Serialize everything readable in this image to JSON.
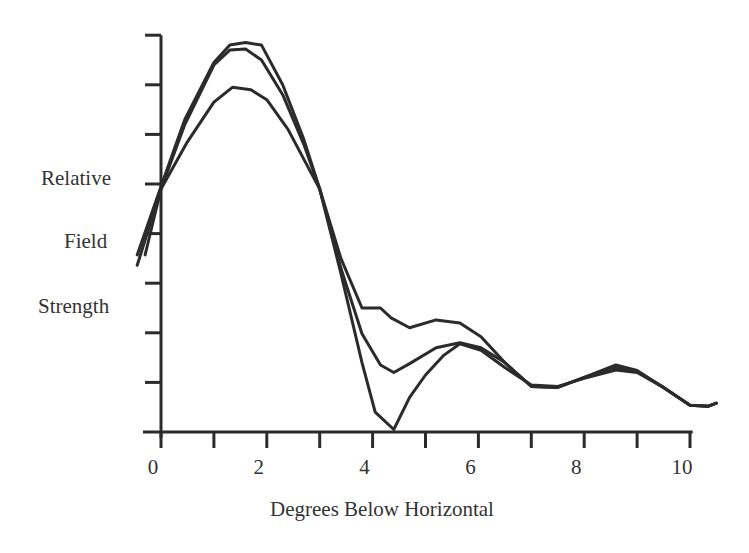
{
  "chart_data": {
    "type": "line",
    "title": "",
    "xlabel": "Degrees Below Horizontal",
    "ylabel": [
      "Relative",
      "Field",
      "Strength"
    ],
    "xlim": [
      -0.5,
      10.5
    ],
    "ylim": [
      0,
      8
    ],
    "x_ticks": [
      0,
      1,
      2,
      3,
      4,
      5,
      6,
      7,
      8,
      9,
      10
    ],
    "x_tick_labels": [
      "0",
      "2",
      "4",
      "6",
      "8",
      "10"
    ],
    "x_tick_label_values": [
      0,
      2,
      4,
      6,
      8,
      10
    ],
    "y_ticks": [
      1,
      2,
      3,
      4,
      5,
      6,
      7,
      8
    ],
    "y_tick_labels": [],
    "grid": false,
    "legend": null,
    "series": [
      {
        "name": "Curve A",
        "points": [
          [
            -0.45,
            3.57
          ],
          [
            0.0,
            4.95
          ],
          [
            0.45,
            6.3
          ],
          [
            1.0,
            7.45
          ],
          [
            1.3,
            7.8
          ],
          [
            1.6,
            7.85
          ],
          [
            1.9,
            7.8
          ],
          [
            2.3,
            7.0
          ],
          [
            2.7,
            5.9
          ],
          [
            3.0,
            4.9
          ],
          [
            3.4,
            3.5
          ],
          [
            3.8,
            2.5
          ],
          [
            4.15,
            2.5
          ],
          [
            4.35,
            2.3
          ],
          [
            4.7,
            2.1
          ],
          [
            5.2,
            2.26
          ],
          [
            5.65,
            2.2
          ],
          [
            6.05,
            1.92
          ],
          [
            6.5,
            1.4
          ],
          [
            7.0,
            0.92
          ],
          [
            7.5,
            0.9
          ],
          [
            8.0,
            1.1
          ],
          [
            8.6,
            1.35
          ],
          [
            9.0,
            1.24
          ],
          [
            9.5,
            0.9
          ],
          [
            10.0,
            0.54
          ],
          [
            10.35,
            0.52
          ],
          [
            10.5,
            0.58
          ]
        ]
      },
      {
        "name": "Curve B",
        "points": [
          [
            -0.45,
            3.36
          ],
          [
            0.0,
            4.9
          ],
          [
            0.45,
            6.2
          ],
          [
            1.0,
            7.4
          ],
          [
            1.3,
            7.7
          ],
          [
            1.6,
            7.72
          ],
          [
            1.9,
            7.5
          ],
          [
            2.3,
            6.8
          ],
          [
            2.7,
            5.8
          ],
          [
            3.0,
            4.9
          ],
          [
            3.4,
            3.3
          ],
          [
            3.8,
            1.98
          ],
          [
            4.15,
            1.35
          ],
          [
            4.4,
            1.2
          ],
          [
            4.7,
            1.38
          ],
          [
            5.2,
            1.7
          ],
          [
            5.65,
            1.8
          ],
          [
            6.05,
            1.7
          ],
          [
            6.5,
            1.4
          ],
          [
            7.0,
            0.92
          ],
          [
            7.5,
            0.9
          ],
          [
            8.0,
            1.1
          ],
          [
            8.6,
            1.3
          ],
          [
            9.0,
            1.22
          ],
          [
            9.5,
            0.9
          ],
          [
            10.0,
            0.54
          ],
          [
            10.35,
            0.52
          ],
          [
            10.5,
            0.58
          ]
        ]
      },
      {
        "name": "Curve C",
        "points": [
          [
            -0.3,
            3.57
          ],
          [
            0.0,
            4.9
          ],
          [
            0.5,
            5.85
          ],
          [
            1.0,
            6.65
          ],
          [
            1.35,
            6.95
          ],
          [
            1.7,
            6.9
          ],
          [
            2.0,
            6.7
          ],
          [
            2.4,
            6.1
          ],
          [
            2.8,
            5.3
          ],
          [
            3.0,
            4.9
          ],
          [
            3.4,
            3.2
          ],
          [
            3.8,
            1.4
          ],
          [
            4.05,
            0.4
          ],
          [
            4.4,
            0.05
          ],
          [
            4.7,
            0.7
          ],
          [
            5.0,
            1.15
          ],
          [
            5.35,
            1.55
          ],
          [
            5.65,
            1.78
          ],
          [
            6.05,
            1.65
          ],
          [
            6.5,
            1.3
          ],
          [
            7.0,
            0.95
          ],
          [
            7.5,
            0.92
          ],
          [
            8.0,
            1.08
          ],
          [
            8.6,
            1.25
          ],
          [
            9.0,
            1.2
          ],
          [
            9.5,
            0.9
          ],
          [
            10.0,
            0.54
          ],
          [
            10.35,
            0.52
          ],
          [
            10.5,
            0.58
          ]
        ]
      }
    ]
  },
  "style": {
    "line_color": "#2b2b2b",
    "axis_color": "#2b2b2b",
    "background": "#ffffff"
  }
}
